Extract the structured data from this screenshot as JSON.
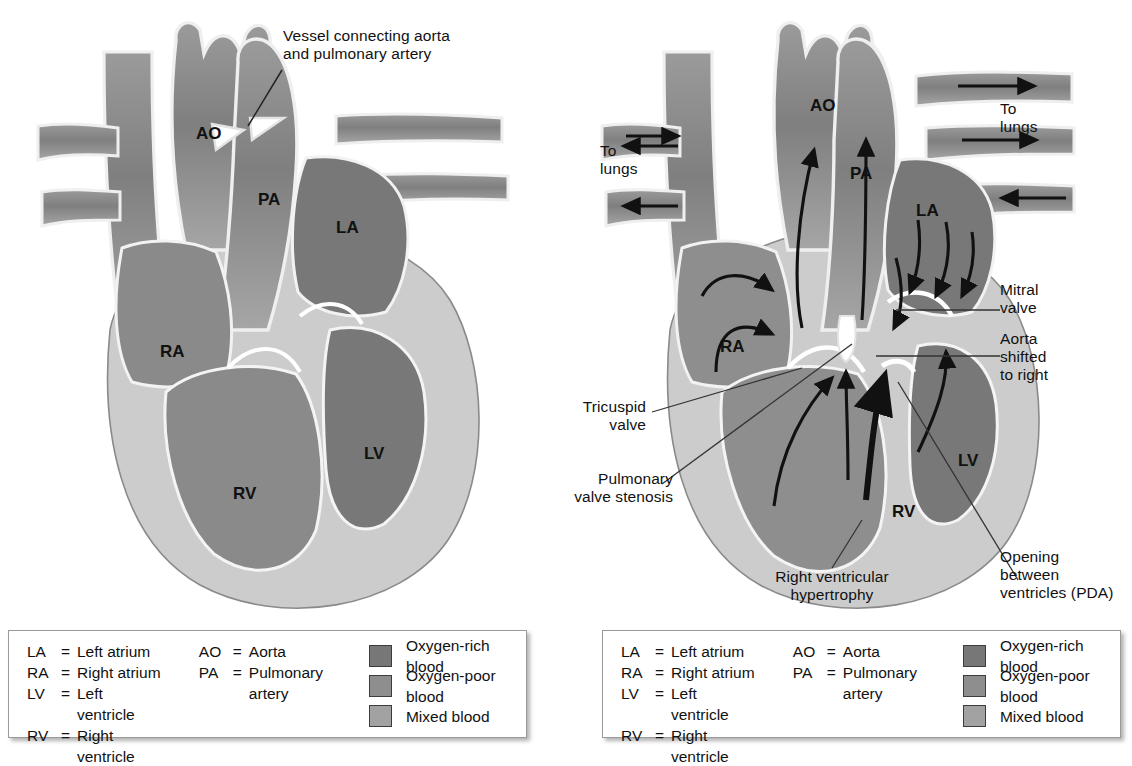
{
  "figure": {
    "type": "anatomical-diagram",
    "panels": [
      {
        "id": "left",
        "chamber_labels": [
          {
            "text": "AO",
            "x": 196,
            "y": 132
          },
          {
            "text": "PA",
            "x": 262,
            "y": 198
          },
          {
            "text": "LA",
            "x": 342,
            "y": 226
          },
          {
            "text": "RA",
            "x": 167,
            "y": 350
          },
          {
            "text": "LV",
            "x": 371,
            "y": 452
          },
          {
            "text": "RV",
            "x": 240,
            "y": 492
          }
        ],
        "callouts": [
          {
            "name": "vessel-connecting",
            "text": "Vessel connecting aorta\nand pulmonary artery",
            "x": 283,
            "y": 27,
            "align": "left"
          }
        ]
      },
      {
        "id": "right",
        "chamber_labels": [
          {
            "text": "AO",
            "x": 815,
            "y": 104
          },
          {
            "text": "PA",
            "x": 855,
            "y": 172
          },
          {
            "text": "LA",
            "x": 921,
            "y": 209
          },
          {
            "text": "RA",
            "x": 727,
            "y": 345
          },
          {
            "text": "LV",
            "x": 965,
            "y": 459
          },
          {
            "text": "RV",
            "x": 899,
            "y": 510
          }
        ],
        "callouts": [
          {
            "name": "to-lungs-left",
            "text": "To\nlungs",
            "x": 600,
            "y": 142,
            "align": "left"
          },
          {
            "name": "to-lungs-right",
            "text": "To\nlungs",
            "x": 1000,
            "y": 100,
            "align": "left"
          },
          {
            "name": "mitral-valve",
            "text": "Mitral\nvalve",
            "x": 1000,
            "y": 281,
            "align": "left"
          },
          {
            "name": "aorta-shifted",
            "text": "Aorta\nshifted\nto right",
            "x": 1000,
            "y": 330,
            "align": "left"
          },
          {
            "name": "tricuspid-valve",
            "text": "Tricuspid\nvalve",
            "x": 583,
            "y": 405,
            "align": "left"
          },
          {
            "name": "pulmonary-valve-stenosis",
            "text": "Pulmonary\nvalve stenosis",
            "x": 583,
            "y": 477,
            "align": "left"
          },
          {
            "name": "right-ventricular-hypertrophy",
            "text": "Right ventricular\nhypertrophy",
            "x": 836,
            "y": 575,
            "align": "center"
          },
          {
            "name": "opening-between-ventricles",
            "text": "Opening\nbetween\nventricles (PDA)",
            "x": 1020,
            "y": 555,
            "align": "left"
          }
        ]
      }
    ]
  },
  "legend": {
    "abbreviations_col1": [
      {
        "key": "LA",
        "eq": "=",
        "value": "Left atrium"
      },
      {
        "key": "RA",
        "eq": "=",
        "value": "Right atrium"
      },
      {
        "key": "LV",
        "eq": "=",
        "value": "Left ventricle"
      },
      {
        "key": "RV",
        "eq": "=",
        "value": "Right ventricle"
      }
    ],
    "abbreviations_col2": [
      {
        "key": "AO",
        "eq": "=",
        "value": "Aorta"
      },
      {
        "key": "PA",
        "eq": "=",
        "value": "Pulmonary\n   artery"
      }
    ],
    "swatches": [
      {
        "label": "Oxygen-rich blood",
        "color": "#777777"
      },
      {
        "label": "Oxygen-poor blood",
        "color": "#8e8e8e"
      },
      {
        "label": "Mixed blood",
        "color": "#a2a2a2"
      }
    ]
  },
  "colors": {
    "oxygen_rich": "#777777",
    "oxygen_poor": "#8e8e8e",
    "mixed": "#a2a2a2",
    "myocardium": "#c9c9c9",
    "vessel_wall": "#e8e8e8",
    "outline": "#6f6f6f",
    "ink": "#111111"
  }
}
